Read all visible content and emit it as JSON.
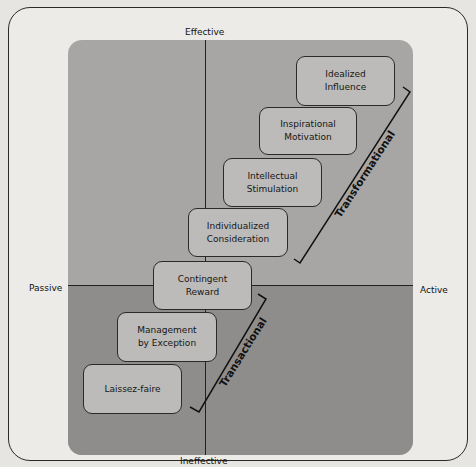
{
  "diagram": {
    "type": "full-range-leadership-model",
    "axes": {
      "top": "Effective",
      "bottom": "Ineffective",
      "left": "Passive",
      "right": "Active"
    },
    "styles": [
      {
        "line1": "Idealized",
        "line2": "Influence"
      },
      {
        "line1": "Inspirational",
        "line2": "Motivation"
      },
      {
        "line1": "Intellectual",
        "line2": "Stimulation"
      },
      {
        "line1": "Individualized",
        "line2": "Consideration"
      },
      {
        "line1": "Contingent",
        "line2": "Reward"
      },
      {
        "line1": "Management",
        "line2": "by Exception"
      },
      {
        "line1": "Laissez-faire",
        "line2": ""
      }
    ],
    "groups": {
      "transformational": "Transformational",
      "transactional": "Transactional"
    },
    "colors": {
      "upper_panel": "#a7a6a4",
      "lower_panel": "#8e8d8b",
      "box_fill": "#bcbbb9",
      "stroke": "#2a2a2a"
    }
  }
}
